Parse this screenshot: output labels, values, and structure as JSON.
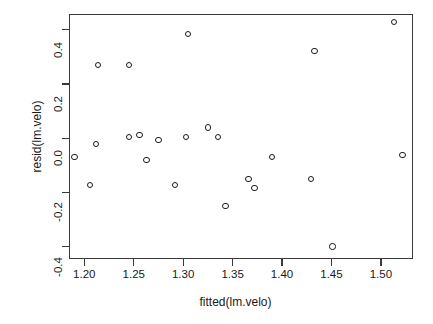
{
  "chart_data": {
    "type": "scatter",
    "title": "",
    "xlabel": "fitted(lm.velo)",
    "ylabel": "resid(lm.velo)",
    "xlim": [
      1.1845,
      1.5325
    ],
    "ylim": [
      -0.4455,
      0.4585
    ],
    "xticks": [
      1.2,
      1.25,
      1.3,
      1.35,
      1.4,
      1.45,
      1.5
    ],
    "xticklabels": [
      "1.20",
      "1.25",
      "1.30",
      "1.35",
      "1.40",
      "1.45",
      "1.50"
    ],
    "yticks": [
      0.4,
      0.2,
      0.0,
      -0.2,
      -0.4
    ],
    "yticklabels": [
      "0.4",
      "0.2",
      "0.0",
      "-0.2",
      "-0.4"
    ],
    "grid": false,
    "legend": null,
    "marker": "open-circle",
    "marker_color": "#1b1b1b",
    "points": [
      {
        "x": 1.19,
        "y": -0.07
      },
      {
        "x": 1.206,
        "y": -0.172
      },
      {
        "x": 1.214,
        "y": 0.271
      },
      {
        "x": 1.212,
        "y": -0.022
      },
      {
        "x": 1.245,
        "y": 0.271
      },
      {
        "x": 1.245,
        "y": 0.004
      },
      {
        "x": 1.256,
        "y": 0.011
      },
      {
        "x": 1.263,
        "y": -0.08
      },
      {
        "x": 1.275,
        "y": -0.007
      },
      {
        "x": 1.292,
        "y": -0.172
      },
      {
        "x": 1.305,
        "y": 0.384
      },
      {
        "x": 1.303,
        "y": 0.004
      },
      {
        "x": 1.325,
        "y": 0.04
      },
      {
        "x": 1.335,
        "y": 0.004
      },
      {
        "x": 1.343,
        "y": -0.249
      },
      {
        "x": 1.366,
        "y": -0.15
      },
      {
        "x": 1.372,
        "y": -0.183
      },
      {
        "x": 1.39,
        "y": -0.07
      },
      {
        "x": 1.429,
        "y": -0.15
      },
      {
        "x": 1.433,
        "y": 0.322
      },
      {
        "x": 1.451,
        "y": -0.399
      },
      {
        "x": 1.513,
        "y": 0.428
      },
      {
        "x": 1.522,
        "y": -0.062
      }
    ]
  },
  "axes": {
    "box_color": "#3a3a3a",
    "tick_color": "#3a3a3a"
  }
}
